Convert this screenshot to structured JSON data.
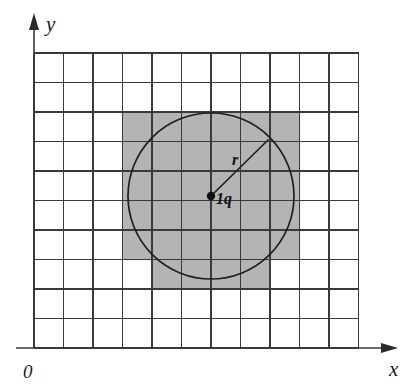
{
  "figure": {
    "type": "geometry-diagram"
  },
  "axes": {
    "x_label": "x",
    "y_label": "y",
    "origin_label": "0",
    "x_arrow": "right-arrow-icon",
    "y_arrow": "up-arrow-icon"
  },
  "annotations": {
    "radius_label": "r",
    "charge_label": "1q",
    "center_dot": "point-marker"
  },
  "colors": {
    "shade_fill": "#b4b4b4",
    "grid_stroke": "#3a3a3a",
    "ink": "#1f1f1f",
    "background": "#ffffff"
  },
  "chart_data": {
    "type": "scatter",
    "title": "",
    "xlabel": "x",
    "ylabel": "y",
    "grid": true,
    "grid_columns": 11,
    "grid_rows": 10,
    "cell_size": 29.5,
    "grid_origin_px": [
      34,
      53
    ],
    "circle": {
      "center_px": [
        211,
        196
      ],
      "center_cell": [
        6,
        5
      ],
      "radius_px": 83,
      "radius_cells": 2.8
    },
    "radius_line": {
      "from_px": [
        211,
        196
      ],
      "to_px": [
        268,
        140
      ],
      "label": "r",
      "label_px": [
        232,
        165
      ]
    },
    "charge": {
      "label": "1q",
      "position_px": [
        211,
        196
      ],
      "label_px": [
        216,
        204
      ]
    },
    "shaded_cells": [
      {
        "row": 2,
        "cols": [
          3,
          4,
          5,
          6,
          7,
          8
        ]
      },
      {
        "row": 3,
        "cols": [
          3,
          4,
          5,
          6,
          7,
          8
        ]
      },
      {
        "row": 4,
        "cols": [
          3,
          4,
          5,
          6,
          7,
          8
        ]
      },
      {
        "row": 5,
        "cols": [
          3,
          4,
          5,
          6,
          7,
          8
        ]
      },
      {
        "row": 6,
        "cols": [
          3,
          4,
          5,
          6,
          7,
          8
        ]
      },
      {
        "row": 7,
        "cols": [
          4,
          5,
          6,
          7
        ]
      }
    ]
  }
}
